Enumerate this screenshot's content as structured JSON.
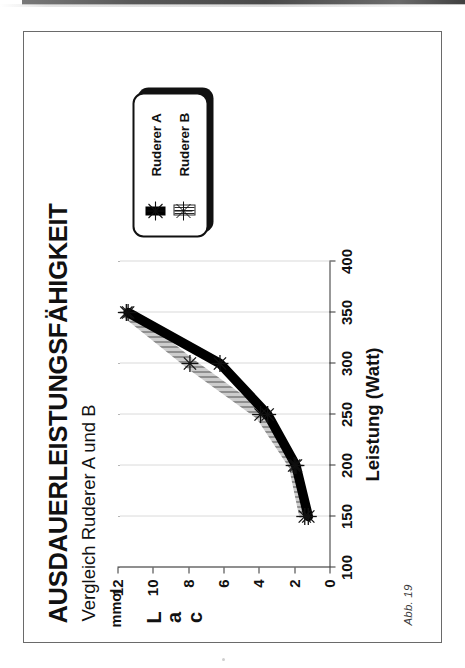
{
  "page": {
    "caption": "Abb. 19",
    "orientation_deg": -90
  },
  "chart_data": {
    "type": "line",
    "title": "AUSDAUERLEISTUNGSFÄHIGKEIT",
    "subtitle": "Vergleich Ruderer A und B",
    "xlabel": "Leistung (Watt)",
    "ylabel": "Lac",
    "yunit": "mmol",
    "xlim": [
      100,
      400
    ],
    "ylim": [
      0,
      12
    ],
    "xticks": [
      100,
      150,
      200,
      250,
      300,
      350,
      400
    ],
    "xticklabels": [
      "100",
      "150",
      "200",
      "250",
      "300",
      "350",
      "400"
    ],
    "yticks": [
      0,
      2,
      4,
      6,
      8,
      10,
      12
    ],
    "yticklabels": [
      "0",
      "2",
      "4",
      "6",
      "8",
      "10",
      "12"
    ],
    "grid": "vertical-dotted",
    "legend_position": "top-right",
    "marker": "star-x",
    "series": [
      {
        "name": "Ruderer A",
        "style": "solid-thick",
        "color": "#000000",
        "x": [
          150,
          200,
          250,
          300,
          350
        ],
        "y": [
          1.2,
          1.9,
          3.5,
          6.2,
          11.4
        ]
      },
      {
        "name": "Ruderer B",
        "style": "hatched",
        "color": "#2a2a2a",
        "x": [
          150,
          200,
          250,
          300,
          350
        ],
        "y": [
          1.4,
          2.0,
          3.9,
          7.9,
          11.5
        ]
      }
    ]
  },
  "legend": {
    "items": [
      {
        "label": "Ruderer A",
        "swatch": "solid"
      },
      {
        "label": "Ruderer B",
        "swatch": "hatch"
      }
    ]
  }
}
